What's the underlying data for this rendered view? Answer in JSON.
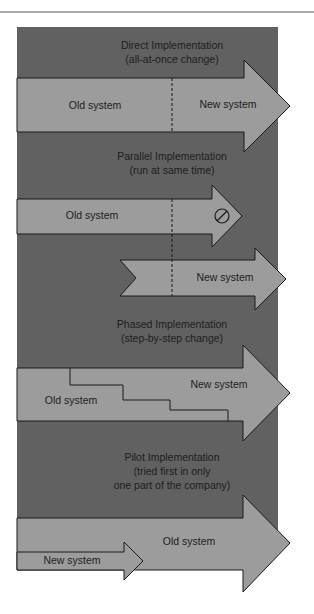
{
  "colors": {
    "panel": "#616161",
    "arrow": "#9c9c9c",
    "stroke": "#1a1a1a",
    "rule": "#555555",
    "text": "#1c1c1c"
  },
  "sections": [
    {
      "title": "Direct Implementation",
      "subtitle": "(all-at-once change)",
      "labels": {
        "old": "Old system",
        "new": "New system"
      }
    },
    {
      "title": "Parallel Implementation",
      "subtitle": "(run at same time)",
      "labels": {
        "old": "Old system",
        "new": "New system"
      },
      "end_icon": "prohibited-icon"
    },
    {
      "title": "Phased Implementation",
      "subtitle": "(step-by-step change)",
      "labels": {
        "old": "Old system",
        "new": "New system"
      }
    },
    {
      "title": "Pilot Implementation",
      "subtitle_lines": [
        "(tried first in only",
        "one part of the company)"
      ],
      "labels": {
        "old": "Old system",
        "new": "New system"
      }
    }
  ]
}
